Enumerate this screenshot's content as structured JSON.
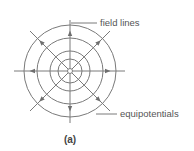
{
  "diagram": {
    "caption": "(a)",
    "labels": {
      "field_lines": "field lines",
      "equipotentials": "equipotentials"
    },
    "center": [
      70,
      71
    ],
    "equipotential_radii": [
      46,
      33,
      20,
      12
    ],
    "field_line_count": 8,
    "colors": {
      "line": "#7a7a7a",
      "text": "#555555"
    }
  }
}
